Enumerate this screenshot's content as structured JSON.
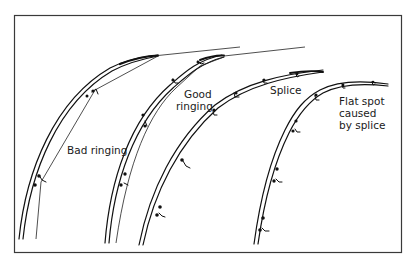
{
  "diagram": {
    "labels": {
      "bad_ringing": "Bad ringing",
      "good_ringing_line1": "Good",
      "good_ringing_line2": "ringing",
      "splice": "Splice",
      "flat_spot_line1": "Flat spot",
      "flat_spot_line2": "caused",
      "flat_spot_line3": "by splice"
    },
    "rods": [
      {
        "name": "bad-ringing-rod",
        "label": "Bad ringing"
      },
      {
        "name": "good-ringing-rod",
        "label": "Good ringing"
      },
      {
        "name": "splice-rod",
        "label": "Splice"
      },
      {
        "name": "flat-spot-rod",
        "label": "Flat spot caused by splice"
      }
    ],
    "colors": {
      "line": "#111111",
      "frame": "#3a3a3a",
      "background": "#ffffff"
    }
  }
}
